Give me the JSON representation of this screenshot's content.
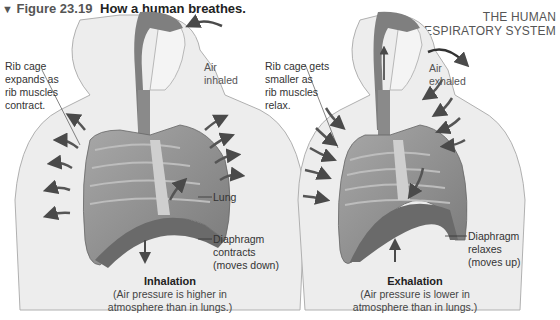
{
  "header": {
    "triangle_icon": "▼",
    "figure_number": "Figure 23.19",
    "caption": "How a human breathes.",
    "section_line1": "THE HUMAN",
    "section_line2": "RESPIRATORY SYSTEM"
  },
  "inhalation": {
    "air_label_1": "Air",
    "air_label_2": "inhaled",
    "rib_label": [
      "Rib cage",
      "expands as",
      "rib muscles",
      "contract."
    ],
    "lung_label": "Lung",
    "diaphragm_label": [
      "Diaphragm",
      "contracts",
      "(moves down)"
    ],
    "phase_name": "Inhalation",
    "phase_desc": [
      "(Air pressure is higher in",
      "atmosphere than in lungs.)"
    ]
  },
  "exhalation": {
    "air_label_1": "Air",
    "air_label_2": "exhaled",
    "rib_label": [
      "Rib cage gets",
      "smaller as",
      "rib muscles",
      "relax."
    ],
    "diaphragm_label": [
      "Diaphragm",
      "relaxes",
      "(moves up)"
    ],
    "phase_name": "Exhalation",
    "phase_desc": [
      "(Air pressure is lower in",
      "atmosphere than in lungs.)"
    ]
  },
  "colors": {
    "skin": "#ececec",
    "outline": "#9a9a9a",
    "lung": "#8c8c8c",
    "arrow": "#4a4a4a",
    "airway": "#7a7a7a"
  }
}
